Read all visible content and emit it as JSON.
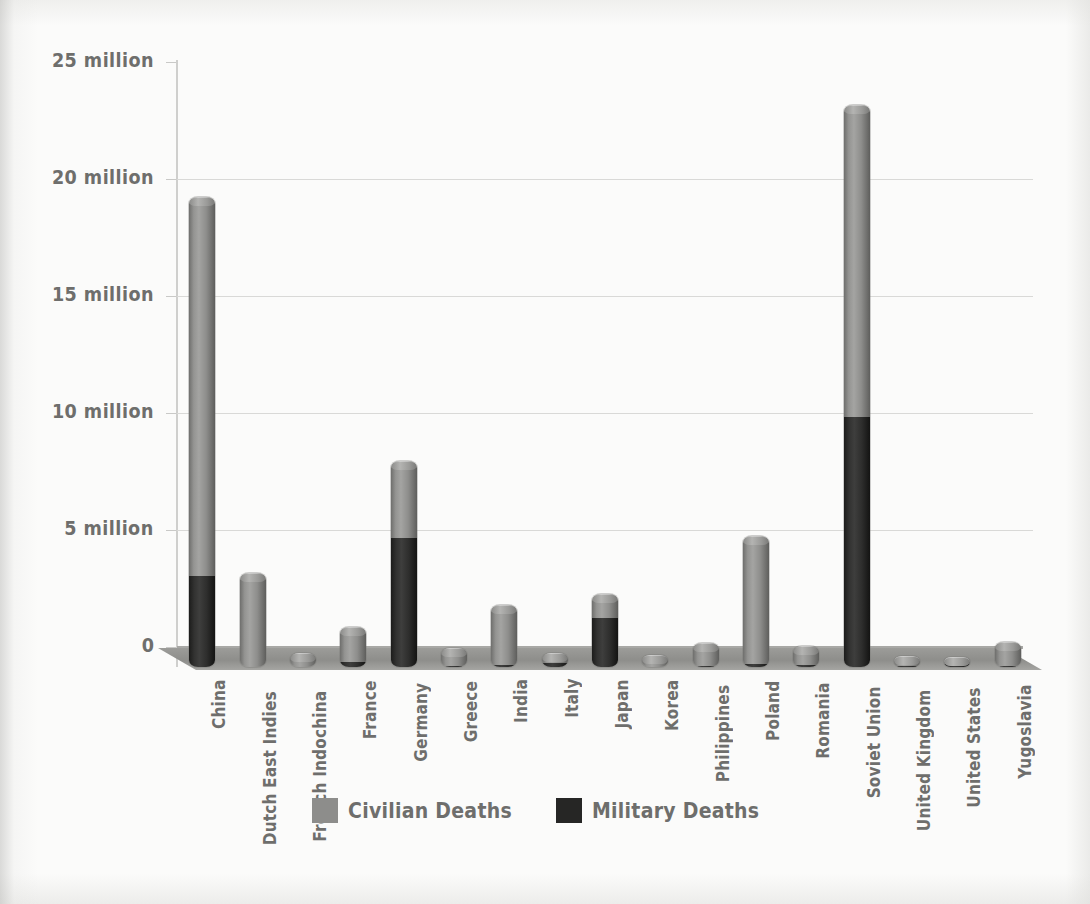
{
  "chart_data": {
    "type": "bar",
    "subtype": "stacked-column-3d",
    "title": "",
    "xlabel": "",
    "ylabel": "",
    "ylim": [
      0,
      25000000
    ],
    "grid": true,
    "legend_position": "bottom-center",
    "ytick_labels": [
      "25 million",
      "20 million",
      "15 million",
      "10 million",
      "5 million",
      "0"
    ],
    "ytick_values": [
      25000000,
      20000000,
      15000000,
      10000000,
      5000000,
      0
    ],
    "categories": [
      "China",
      "Dutch East Indies",
      "French Indochina",
      "France",
      "Germany",
      "Greece",
      "India",
      "Italy",
      "Japan",
      "Korea",
      "Philippines",
      "Poland",
      "Romania",
      "Soviet Union",
      "United Kingdom",
      "United States",
      "Yugoslavia"
    ],
    "series": [
      {
        "name": "Civilian Deaths",
        "color": "#8d8d8b",
        "values": [
          16200000,
          4000000,
          600000,
          1500000,
          3300000,
          750000,
          2550000,
          450000,
          1000000,
          500000,
          950000,
          5500000,
          800000,
          13300000,
          400000,
          300000,
          1000000
        ]
      },
      {
        "name": "Military Deaths",
        "color": "#262625",
        "values": [
          3900000,
          0,
          0,
          200000,
          5500000,
          50000,
          90000,
          150000,
          2100000,
          0,
          60000,
          120000,
          80000,
          10700000,
          60000,
          120000,
          50000
        ]
      }
    ],
    "totals": [
      20100000,
      4000000,
      600000,
      1700000,
      8800000,
      800000,
      2640000,
      600000,
      3100000,
      500000,
      1010000,
      5620000,
      880000,
      24000000,
      460000,
      420000,
      1050000
    ]
  },
  "legend": {
    "items": [
      {
        "label": "Civilian Deaths",
        "swatch": "civ"
      },
      {
        "label": "Military Deaths",
        "swatch": "mil"
      }
    ]
  },
  "colors": {
    "civilian": "#8d8d8b",
    "military": "#262625",
    "text": "#6e6e6c",
    "grid": "#d9d9d7",
    "floor": "#9c9c99",
    "background": "#fbfbfa"
  }
}
